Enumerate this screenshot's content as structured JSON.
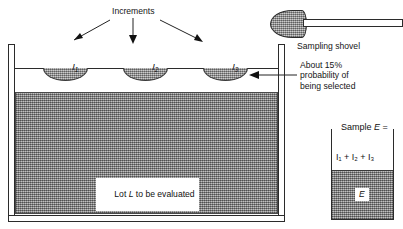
{
  "diagram": {
    "title_hidden": "",
    "labels": {
      "increments": "Increments",
      "increment_1": "I",
      "increment_1_sub": "1",
      "increment_2": "I",
      "increment_2_sub": "2",
      "increment_3": "I",
      "increment_3_sub": "3",
      "lot_label_pre": "Lot ",
      "lot_label_sym": "L",
      "lot_label_post": " to be evaluated",
      "sampling_shovel": "Sampling shovel",
      "probability_note": "About 15%\nprobability of\nbeing selected",
      "probability_percent": "15%",
      "sample_header_pre": "Sample ",
      "sample_header_sym": "E",
      "sample_header_eq": " =",
      "sample_sum": "I₁ + I₂ + I₃",
      "sample_fill_label": "E"
    },
    "colors": {
      "ink": "#1a1a1a",
      "line": "#2b2b2b",
      "lot_fill": "#9a9a9a",
      "increment_fill": "#a6a6a6",
      "background": "#ffffff"
    }
  }
}
